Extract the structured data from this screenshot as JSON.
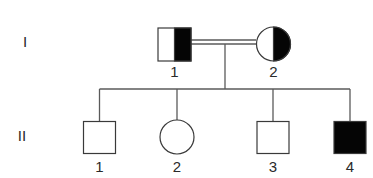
{
  "diagram": {
    "type": "pedigree",
    "colors": {
      "background": "#ffffff",
      "line": "#5a5a5a",
      "stroke": "#3a3a3a",
      "affected": "#050505",
      "unaffected": "#ffffff",
      "text": "#2a2a2a"
    },
    "generations": [
      {
        "label": "I",
        "x": 25,
        "y": 47
      },
      {
        "label": "II",
        "x": 22,
        "y": 141
      }
    ],
    "individuals": [
      {
        "id": "I-1",
        "generation": "I",
        "number": "1",
        "sex": "male",
        "status": "carrier",
        "fill": "right-half",
        "cx": 174.5,
        "cy": 44.5,
        "size": 33,
        "label_y": 77
      },
      {
        "id": "I-2",
        "generation": "I",
        "number": "2",
        "sex": "female",
        "status": "carrier",
        "fill": "right-half",
        "cx": 273.5,
        "cy": 44,
        "size": 34,
        "label_y": 77
      },
      {
        "id": "II-1",
        "generation": "II",
        "number": "1",
        "sex": "male",
        "status": "unaffected",
        "fill": "none",
        "cx": 99.5,
        "cy": 137.5,
        "size": 32,
        "label_y": 172
      },
      {
        "id": "II-2",
        "generation": "II",
        "number": "2",
        "sex": "female",
        "status": "unaffected",
        "fill": "none",
        "cx": 177,
        "cy": 137,
        "size": 34,
        "label_y": 172
      },
      {
        "id": "II-3",
        "generation": "II",
        "number": "3",
        "sex": "male",
        "status": "unaffected",
        "fill": "none",
        "cx": 273,
        "cy": 137.5,
        "size": 32,
        "label_y": 172
      },
      {
        "id": "II-4",
        "generation": "II",
        "number": "4",
        "sex": "male",
        "status": "affected",
        "fill": "full",
        "cx": 350,
        "cy": 137.5,
        "size": 32,
        "label_y": 172
      }
    ],
    "relationships": [
      {
        "type": "consanguineous-mating",
        "partners": [
          "I-1",
          "I-2"
        ],
        "y1": 40,
        "y2": 44,
        "x_from": 191,
        "x_to": 256
      },
      {
        "type": "descent",
        "from_x": 225,
        "from_y": 44,
        "to_y": 89
      },
      {
        "type": "sibship",
        "y": 89,
        "x_from": 99.5,
        "x_to": 350,
        "drops": [
          99.5,
          177,
          273,
          350
        ],
        "drop_to": [
          121.5,
          120,
          121.5,
          121.5
        ]
      }
    ]
  }
}
